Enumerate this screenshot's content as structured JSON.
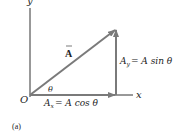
{
  "figure": {
    "panel_label": "(a)",
    "axes": {
      "x_label": "x",
      "y_label": "y",
      "origin_label": "O"
    },
    "vector": {
      "label": "A",
      "angle_label": "θ"
    },
    "components": {
      "x": {
        "lhs": "A",
        "sub": "x",
        "rhs": "= A cos θ"
      },
      "y": {
        "lhs": "A",
        "sub": "y",
        "rhs": "= A sin θ"
      }
    },
    "colors": {
      "axis": "#333333",
      "vector": "#7a7a7a",
      "text": "#222222"
    }
  }
}
